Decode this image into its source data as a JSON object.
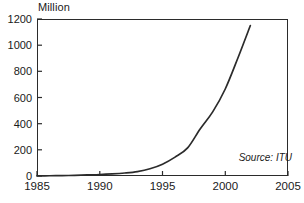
{
  "chart_data": {
    "type": "line",
    "title": "",
    "subtitle": "",
    "xlabel": "",
    "ylabel": "Million",
    "unit_label": "Million",
    "xlim": [
      1985,
      2005
    ],
    "ylim": [
      0,
      1200
    ],
    "grid": false,
    "legend": false,
    "legend_position": "none",
    "annotations": [
      {
        "name": "source",
        "text": "Source: ITU"
      }
    ],
    "x_ticks": [
      1985,
      1990,
      1995,
      2000,
      2005
    ],
    "x_tick_labels": [
      "1985",
      "1990",
      "1995",
      "2000",
      "2005"
    ],
    "y_ticks": [
      0,
      200,
      400,
      600,
      800,
      1000,
      1200
    ],
    "y_tick_labels": [
      "0",
      "200",
      "400",
      "600",
      "800",
      "1000",
      "1200"
    ],
    "series": [
      {
        "name": "Mobile subscribers",
        "color": "#2b2b2b",
        "x": [
          1985,
          1986,
          1987,
          1988,
          1989,
          1990,
          1991,
          1992,
          1993,
          1994,
          1995,
          1996,
          1997,
          1998,
          1999,
          2000,
          2001,
          2002
        ],
        "values": [
          1,
          2,
          3,
          5,
          8,
          11,
          16,
          23,
          34,
          55,
          90,
          144,
          215,
          360,
          490,
          665,
          900,
          1150
        ]
      }
    ]
  },
  "axes": {
    "unit_label": "Million",
    "frame_color": "#2b2b2b",
    "tick_color": "#2b2b2b"
  },
  "source": {
    "text": "Source: ITU"
  }
}
